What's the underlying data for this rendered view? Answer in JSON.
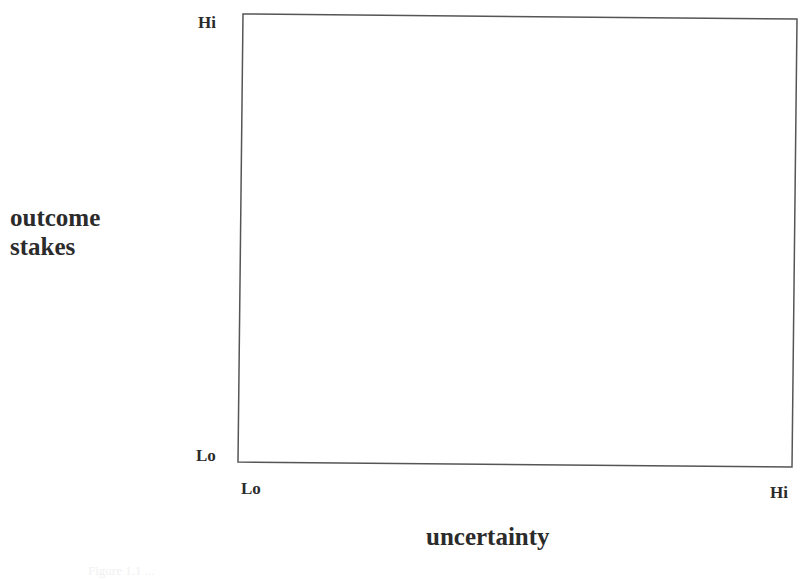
{
  "diagram": {
    "type": "2x2 quadrant frame (empty)",
    "y_axis": {
      "title_line1": "outcome",
      "title_line2": "stakes",
      "high_label": "Hi",
      "low_label": "Lo"
    },
    "x_axis": {
      "title": "uncertainty",
      "low_label": "Lo",
      "high_label": "Hi"
    },
    "frame": {
      "stroke_color": "#555555",
      "corners": {
        "top_left": [
          243,
          14
        ],
        "top_right": [
          797,
          19
        ],
        "bottom_right": [
          792,
          467
        ],
        "bottom_left": [
          238,
          462
        ]
      }
    },
    "caption_faint": "Figure 1.1 ..."
  }
}
